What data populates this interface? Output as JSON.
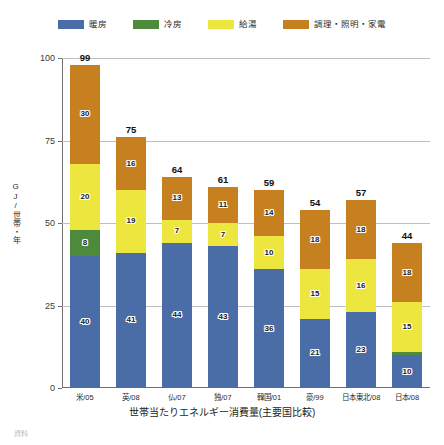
{
  "legend": {
    "items": [
      {
        "label": "暖房",
        "color": "#4a6da7",
        "key": "heating"
      },
      {
        "label": "冷房",
        "color": "#4e8a3b",
        "key": "cooling"
      },
      {
        "label": "給湯",
        "color": "#ede63f",
        "key": "hot_water"
      },
      {
        "label": "調理・照明・家電",
        "color": "#c7801f",
        "key": "appliances"
      }
    ]
  },
  "source_note": "資料",
  "chart_data": {
    "type": "bar",
    "stacked": true,
    "title": "",
    "xlabel": "世帯当たりエネルギー消費量(主要国比較)",
    "ylabel": "GJ/世帯・年",
    "ylim": [
      0,
      100
    ],
    "yticks": [
      0,
      25,
      50,
      75,
      100
    ],
    "ytick_labels": [
      "0",
      "25",
      "50",
      "75",
      "100"
    ],
    "grid": true,
    "legend_position": "top",
    "categories": [
      "米/05",
      "英/08",
      "仏/07",
      "独/07",
      "韓国/01",
      "豪/99",
      "日本東北/08",
      "日本/08"
    ],
    "totals": [
      99,
      75,
      64,
      61,
      59,
      54,
      57,
      44
    ],
    "series": [
      {
        "name": "暖房",
        "color": "#4a6da7",
        "values": [
          40,
          41,
          44,
          43,
          36,
          21,
          23,
          10
        ]
      },
      {
        "name": "冷房",
        "color": "#4e8a3b",
        "values": [
          8,
          0,
          0,
          0,
          0,
          0,
          0,
          1
        ]
      },
      {
        "name": "給湯",
        "color": "#ede63f",
        "values": [
          20,
          19,
          7,
          7,
          10,
          15,
          16,
          15
        ]
      },
      {
        "name": "調理・照明・家電",
        "color": "#c7801f",
        "values": [
          30,
          16,
          13,
          11,
          14,
          18,
          18,
          18
        ]
      }
    ]
  }
}
